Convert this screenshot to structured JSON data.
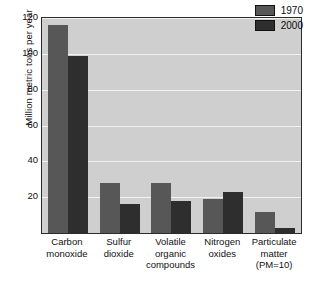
{
  "chart_data": {
    "type": "bar",
    "title": "",
    "subtitle": "",
    "xlabel": "",
    "ylabel": "Million metric tons per year",
    "ylim": [
      0,
      120
    ],
    "yticks": [
      0,
      20,
      40,
      60,
      80,
      100,
      120
    ],
    "ytick_labels": [
      "",
      "20",
      "40",
      "60",
      "80",
      "100",
      "120"
    ],
    "grid": true,
    "grid_color": "#f2f2f2",
    "plot_background": "#cfcfcf",
    "legend_position": "top-right",
    "categories": [
      "Carbon monoxide",
      "Sulfur dioxide",
      "Volatile organic compounds",
      "Nitrogen oxides",
      "Particulate matter (PM=10)"
    ],
    "category_lines": [
      [
        "Carbon",
        "monoxide"
      ],
      [
        "Sulfur",
        "dioxide"
      ],
      [
        "Volatile",
        "organic",
        "compounds"
      ],
      [
        "Nitrogen",
        "oxides"
      ],
      [
        "Particulate",
        "matter",
        "(PM=10)"
      ]
    ],
    "series": [
      {
        "name": "1970",
        "color": "#575757",
        "values": [
          116,
          28,
          28,
          19,
          12
        ]
      },
      {
        "name": "2000",
        "color": "#2e2e2e",
        "values": [
          99,
          16,
          18,
          23,
          3
        ]
      }
    ]
  },
  "legend": {
    "entries": [
      {
        "label": "1970",
        "color": "#575757"
      },
      {
        "label": "2000",
        "color": "#2e2e2e"
      }
    ]
  },
  "axes": {
    "y_title": "Million metric tons per year",
    "y_ticks": [
      "120",
      "100",
      "80",
      "60",
      "40",
      "20"
    ]
  }
}
